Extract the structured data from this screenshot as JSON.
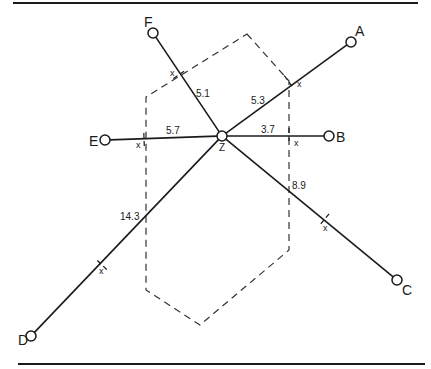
{
  "diagram": {
    "center": {
      "label": "Z",
      "x": 222,
      "y": 136
    },
    "points": [
      {
        "id": "A",
        "label": "A",
        "x": 351,
        "y": 42,
        "lx": 355,
        "ly": 36,
        "distance": "5.3",
        "dx": 251,
        "dy": 104,
        "mark": {
          "x": 289,
          "y": 82,
          "lx": 297,
          "ly": 87
        }
      },
      {
        "id": "B",
        "label": "B",
        "x": 329,
        "y": 136,
        "lx": 336,
        "ly": 142,
        "distance": "3.7",
        "dx": 261,
        "dy": 133,
        "mark": {
          "x": 289,
          "y": 136,
          "lx": 294,
          "ly": 146
        }
      },
      {
        "id": "C",
        "label": "C",
        "x": 397,
        "y": 280,
        "lx": 402,
        "ly": 295,
        "distance": "8.9",
        "dx": 292,
        "dy": 189,
        "mark": {
          "x": 324,
          "y": 220,
          "lx": 323,
          "ly": 231
        }
      },
      {
        "id": "D",
        "label": "D",
        "x": 31,
        "y": 336,
        "lx": 18,
        "ly": 345,
        "distance": "14.3",
        "dx": 120,
        "dy": 220,
        "mark": {
          "x": 101,
          "y": 264,
          "lx": 99,
          "ly": 274
        }
      },
      {
        "id": "E",
        "label": "E",
        "x": 105,
        "y": 140,
        "lx": 89,
        "ly": 146,
        "distance": "5.7",
        "dx": 166,
        "dy": 134,
        "mark": {
          "x": 144,
          "y": 138,
          "lx": 136,
          "ly": 148
        }
      },
      {
        "id": "F",
        "label": "F",
        "x": 153,
        "y": 33,
        "lx": 144,
        "ly": 27,
        "distance": "5.1",
        "dx": 196,
        "dy": 97,
        "mark": {
          "x": 180,
          "y": 74,
          "lx": 170,
          "ly": 76
        }
      }
    ],
    "mark_label": "x",
    "hexagon": [
      [
        247,
        34
      ],
      [
        289,
        81
      ],
      [
        289,
        250
      ],
      [
        200,
        325
      ],
      [
        146,
        290
      ],
      [
        146,
        97
      ]
    ],
    "rules": {
      "top": {
        "x1": 13,
        "x2": 418,
        "y": 3
      },
      "bottom": {
        "x1": 18,
        "x2": 425,
        "y": 364
      }
    }
  }
}
